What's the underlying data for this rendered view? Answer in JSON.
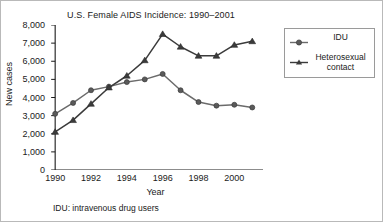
{
  "figure": {
    "footnote": "IDU: intravenous drug users",
    "border_color": "#b9b9b9"
  },
  "legend": {
    "position": "right",
    "items": [
      {
        "label": "IDU",
        "marker": "circle-marker-icon",
        "color": "#6b6b6b"
      },
      {
        "label": "Heterosexual\ncontact",
        "label_line1": "Heterosexual",
        "label_line2": "contact",
        "marker": "triangle-marker-icon",
        "color": "#3b3b3b"
      }
    ]
  },
  "chart_data": {
    "type": "line",
    "title": "U.S. Female AIDS Incidence: 1990–2001",
    "xlabel": "Year",
    "ylabel": "New cases",
    "x": [
      1990,
      1991,
      1992,
      1993,
      1994,
      1995,
      1996,
      1997,
      1998,
      1999,
      2000,
      2001
    ],
    "xlim": [
      1989.6,
      2001.6
    ],
    "ylim": [
      0,
      8000
    ],
    "xticks": [
      1990,
      1991,
      1992,
      1993,
      1994,
      1995,
      1996,
      1997,
      1998,
      1999,
      2000,
      2001
    ],
    "xtick_labels": [
      "1990",
      "",
      "1992",
      "",
      "1994",
      "",
      "1996",
      "",
      "1998",
      "",
      "2000",
      ""
    ],
    "yticks": [
      0,
      1000,
      2000,
      3000,
      4000,
      5000,
      6000,
      7000,
      8000
    ],
    "ytick_labels": [
      "0",
      "1,000",
      "2,000",
      "3,000",
      "4,000",
      "5,000",
      "6,000",
      "7,000",
      "8,000"
    ],
    "grid": false,
    "legend_position": "right",
    "series": [
      {
        "name": "IDU",
        "marker": "circle",
        "color": "#6b6b6b",
        "values": [
          3100,
          3700,
          4400,
          4600,
          4850,
          5000,
          5300,
          4400,
          3750,
          3550,
          3600,
          3450
        ]
      },
      {
        "name": "Heterosexual contact",
        "marker": "triangle",
        "color": "#3b3b3b",
        "values": [
          2100,
          2750,
          3650,
          4550,
          5200,
          6050,
          7500,
          6800,
          6300,
          6300,
          6900,
          7100
        ]
      }
    ]
  }
}
